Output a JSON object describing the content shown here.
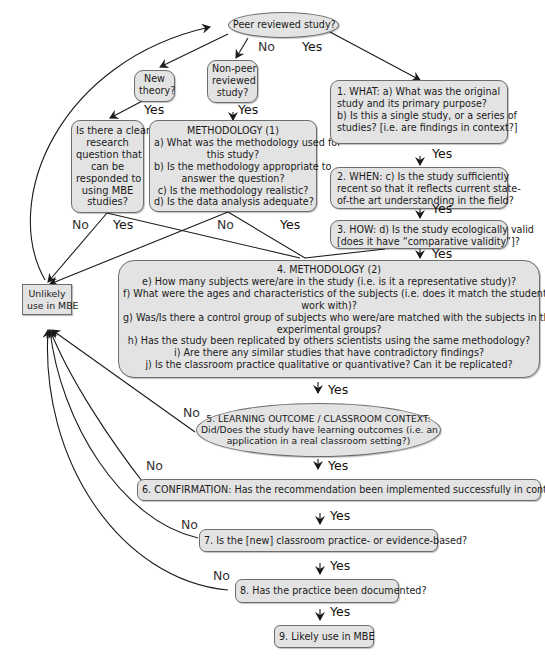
{
  "diagram": {
    "nodes": {
      "peer_reviewed": {
        "lines": [
          "Peer reviewed study?"
        ]
      },
      "new_theory": {
        "lines": [
          "New",
          "theory?"
        ]
      },
      "non_peer": {
        "lines": [
          "Non-peer",
          "reviewed",
          "study?"
        ]
      },
      "research_question": {
        "lines": [
          "Is there a clear",
          "research",
          "question that",
          "can be",
          "responded to",
          "using MBE",
          "studies?"
        ]
      },
      "methodology1": {
        "lines": [
          "METHODOLOGY (1)",
          "a) What was the methodology used for",
          "this study?",
          "b) Is the methodology appropriate to",
          "answer the question?",
          "c) Is the methodology realistic?",
          "d) Is the data analysis adequate?"
        ]
      },
      "what": {
        "lines": [
          "1. WHAT: a) What was the original",
          "study and its primary purpose?",
          "b) Is this a single study, or a series of",
          "studies? [i.e. are findings in context?]"
        ]
      },
      "when": {
        "lines": [
          "2. WHEN: c) Is the study sufficiently",
          "recent so that it reflects current state-",
          "of-the art understanding in the field?"
        ]
      },
      "how": {
        "lines": [
          "3. HOW: d) Is the study ecologically valid",
          "[does it have “comparative validity”]?"
        ]
      },
      "unlikely": {
        "lines": [
          "Unlikely",
          "use in MBE"
        ]
      },
      "methodology2": {
        "lines": [
          "4. METHODOLOGY (2)",
          "e) How many subjects were/are in the study (i.e. is it a representative study)?",
          "f) What were the ages and characteristics of the subjects (i.e. does it match the students you",
          "work with)?",
          "g) Was/Is there a control group of subjects who were/are matched with the subjects in the",
          "experimental groups?",
          "h) Has the study been replicated by others scientists using the same methodology?",
          "i) Are there any similar studies that have contradictory findings?",
          "j) Is the classroom practice qualitative or quantivative? Can it be replicated?"
        ]
      },
      "learning_outcome": {
        "lines": [
          "5. LEARNING OUTCOME / CLASSROOM CONTEXT:",
          "Did/Does the study have learning outcomes (i.e. an",
          "application in a real classroom setting?)"
        ]
      },
      "confirmation": {
        "lines": [
          "6. CONFIRMATION: Has the recommendation been implemented successfully in context?"
        ]
      },
      "practice_based": {
        "lines": [
          "7. Is the [new] classroom practice- or evidence-based?"
        ]
      },
      "documented": {
        "lines": [
          "8. Has the practice been documented?"
        ]
      },
      "likely": {
        "lines": [
          "9. Likely use in MBE"
        ]
      }
    },
    "edge_labels": {
      "peer_no": "No",
      "peer_yes": "Yes",
      "new_theory_yes": "Yes",
      "non_peer_yes": "Yes",
      "rq_no": "No",
      "rq_yes": "Yes",
      "meth1_no": "No",
      "meth1_yes": "Yes",
      "what_yes": "Yes",
      "when_yes": "Yes",
      "how_yes": "Yes",
      "meth2_yes": "Yes",
      "lo_no": "No",
      "lo_yes": "Yes",
      "conf_no": "No",
      "conf_yes": "Yes",
      "practice_no": "No",
      "practice_yes": "Yes",
      "doc_no": "No",
      "doc_yes": "Yes"
    },
    "colors": {
      "node_fill": "#e3e3e3",
      "node_border": "#6e6e6e",
      "line": "#1a1a1a",
      "background": "#ffffff"
    }
  }
}
